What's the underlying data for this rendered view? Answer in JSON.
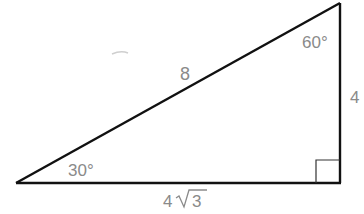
{
  "diagram": {
    "type": "right-triangle",
    "colors": {
      "stroke": "#111111",
      "label": "#8a8a8a",
      "background": "#ffffff"
    },
    "vertices": {
      "A_bottom_left": [
        16,
        183
      ],
      "B_top_right": [
        340,
        3
      ],
      "C_right_angle": [
        340,
        183
      ]
    },
    "labels": {
      "hypotenuse": "8",
      "vertical_leg": "4",
      "horizontal_leg_coef": "4",
      "horizontal_leg_radical": "3",
      "angle_top": "60°",
      "angle_bottom_left": "30°"
    },
    "right_angle_marker": true
  }
}
